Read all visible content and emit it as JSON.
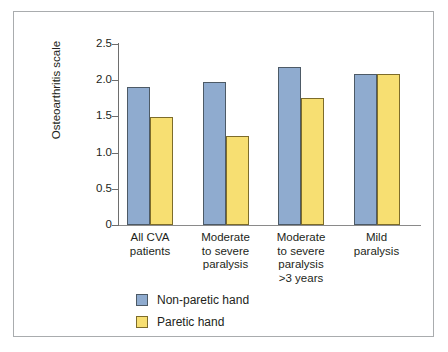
{
  "chart_data": {
    "type": "bar",
    "title": "",
    "subtitle": "",
    "xlabel": "",
    "ylabel": "Osteoarthritis scale",
    "ylim": [
      0,
      2.5
    ],
    "grid": false,
    "legend_position": "bottom-left",
    "categories": [
      "All CVA\npatients",
      "Moderate\nto severe\nparalysis",
      "Moderate\nto severe\nparalysis\n>3 years",
      "Mild\nparalysis"
    ],
    "ytick_labels": [
      "2.5",
      "2.0",
      "1.5",
      "1.0",
      "0.5",
      "0"
    ],
    "ytick_values": [
      2.5,
      2.0,
      1.5,
      1.0,
      0.5,
      0
    ],
    "series": [
      {
        "name": "Non-paretic hand",
        "color": "#8fabcf",
        "values": [
          1.9,
          1.97,
          2.18,
          2.09
        ]
      },
      {
        "name": "Paretic hand",
        "color": "#f7df72",
        "values": [
          1.49,
          1.23,
          1.75,
          2.09
        ]
      }
    ]
  },
  "legend": {
    "items": [
      {
        "label": "Non-paretic hand",
        "color": "#8fabcf"
      },
      {
        "label": "Paretic hand",
        "color": "#f7df72"
      }
    ]
  },
  "colors": {
    "non_paretic": "#8fabcf",
    "paretic": "#f7df72",
    "axis": "#6e6e6e",
    "frame": "#a9acae",
    "text": "#231f20"
  }
}
